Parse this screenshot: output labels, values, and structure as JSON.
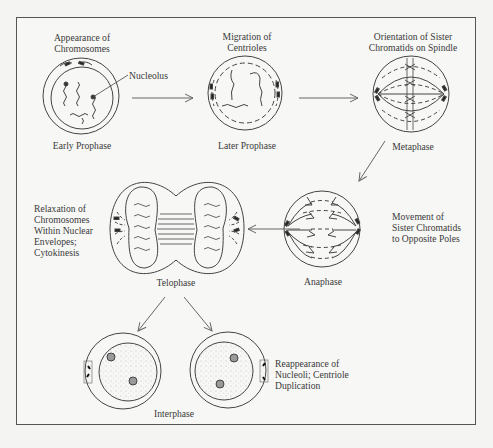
{
  "diagram": {
    "type": "cell-cycle-mitosis",
    "stages": [
      {
        "id": "early-prophase",
        "name": "Early Prophase",
        "caption": [
          "Appearance of",
          "Chromosomes"
        ],
        "callout": "Nucleolus"
      },
      {
        "id": "later-prophase",
        "name": "Later Prophase",
        "caption": [
          "Migration of",
          "Centrioles"
        ]
      },
      {
        "id": "metaphase",
        "name": "Metaphase",
        "caption": [
          "Orientation of Sister",
          "Chromatids on Spindle"
        ]
      },
      {
        "id": "anaphase",
        "name": "Anaphase",
        "caption": [
          "Movement of",
          "Sister Chromatids",
          "to Opposite Poles"
        ]
      },
      {
        "id": "telophase",
        "name": "Telophase",
        "caption": [
          "Relaxation of",
          "Chromosomes",
          "Within Nuclear",
          "Envelopes;",
          "Cytokinesis"
        ]
      },
      {
        "id": "interphase",
        "name": "Interphase",
        "caption": [
          "Reappearance of",
          "Nucleoli; Centriole",
          "Duplication"
        ]
      }
    ],
    "flow": [
      [
        "early-prophase",
        "later-prophase"
      ],
      [
        "later-prophase",
        "metaphase"
      ],
      [
        "metaphase",
        "anaphase"
      ],
      [
        "anaphase",
        "telophase"
      ],
      [
        "telophase",
        "interphase"
      ],
      [
        "telophase",
        "interphase"
      ]
    ],
    "colors": {
      "line": "#444444",
      "border": "#555555",
      "background": "#f7f7f5",
      "nucleolus": "#9a9a9a"
    }
  }
}
